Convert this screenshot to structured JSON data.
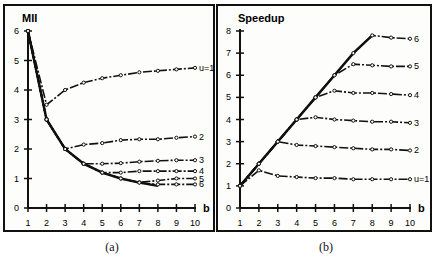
{
  "chart_data": [
    {
      "type": "line",
      "id": "a",
      "caption": "(a)",
      "title": "",
      "ylabel": "MII",
      "xlabel": "b",
      "x": [
        1,
        2,
        3,
        4,
        5,
        6,
        7,
        8,
        9,
        10
      ],
      "xticks": [
        "1",
        "2",
        "3",
        "4",
        "5",
        "6",
        "7",
        "8",
        "9",
        "10"
      ],
      "yticks": [
        "0",
        "1",
        "2",
        "3",
        "4",
        "5",
        "6"
      ],
      "ylim": [
        0,
        6
      ],
      "grid": false,
      "legend": "inline labels at line ends",
      "envelope": {
        "x": [
          1,
          2,
          3,
          4,
          5,
          6,
          7,
          8
        ],
        "values": [
          6,
          3,
          2,
          1.5,
          1.2,
          1.0,
          0.86,
          0.75
        ]
      },
      "series": [
        {
          "name": "u=1",
          "values": [
            6,
            3.5,
            4.0,
            4.25,
            4.4,
            4.5,
            4.6,
            4.65,
            4.7,
            4.75
          ]
        },
        {
          "name": "2",
          "values": [
            6,
            3,
            2.0,
            2.15,
            2.2,
            2.3,
            2.33,
            2.33,
            2.38,
            2.42
          ]
        },
        {
          "name": "3",
          "values": [
            6,
            3,
            2,
            1.5,
            1.5,
            1.52,
            1.57,
            1.6,
            1.62,
            1.62
          ]
        },
        {
          "name": "4",
          "values": [
            6,
            3,
            2,
            1.5,
            1.2,
            1.2,
            1.25,
            1.25,
            1.25,
            1.25
          ]
        },
        {
          "name": "5",
          "values": [
            6,
            3,
            2,
            1.5,
            1.2,
            1.0,
            0.87,
            0.93,
            1.0,
            1.0
          ]
        },
        {
          "name": "6",
          "values": [
            6,
            3,
            2,
            1.5,
            1.2,
            1.0,
            0.86,
            0.8,
            0.8,
            0.8
          ]
        }
      ]
    },
    {
      "type": "line",
      "id": "b",
      "caption": "(b)",
      "title": "",
      "ylabel": "Speedup",
      "xlabel": "b",
      "x": [
        1,
        2,
        3,
        4,
        5,
        6,
        7,
        8,
        9,
        10
      ],
      "xticks": [
        "1",
        "2",
        "3",
        "4",
        "5",
        "6",
        "7",
        "8",
        "9",
        "10"
      ],
      "yticks": [
        "0",
        "1",
        "2",
        "3",
        "4",
        "5",
        "6",
        "7",
        "8"
      ],
      "ylim": [
        0,
        8
      ],
      "grid": false,
      "legend": "inline labels at line ends",
      "envelope": {
        "x": [
          1,
          2,
          3,
          4,
          5,
          6,
          7,
          8
        ],
        "values": [
          1,
          2,
          3,
          4,
          5,
          6,
          7,
          7.8
        ]
      },
      "series": [
        {
          "name": "u=1",
          "values": [
            1,
            1.7,
            1.45,
            1.4,
            1.35,
            1.35,
            1.3,
            1.3,
            1.3,
            1.3
          ]
        },
        {
          "name": "2",
          "values": [
            1,
            2,
            3.0,
            2.85,
            2.8,
            2.75,
            2.7,
            2.65,
            2.65,
            2.6
          ]
        },
        {
          "name": "3",
          "values": [
            1,
            2,
            3,
            4.0,
            4.1,
            4.0,
            3.95,
            3.9,
            3.9,
            3.85
          ]
        },
        {
          "name": "4",
          "values": [
            1,
            2,
            3,
            4,
            5.0,
            5.3,
            5.2,
            5.2,
            5.15,
            5.1
          ]
        },
        {
          "name": "5",
          "values": [
            1,
            2,
            3,
            4,
            5,
            6.0,
            6.5,
            6.45,
            6.4,
            6.4
          ]
        },
        {
          "name": "6",
          "values": [
            1,
            2,
            3,
            4,
            5,
            6,
            7.0,
            7.8,
            7.7,
            7.65
          ]
        }
      ]
    }
  ]
}
